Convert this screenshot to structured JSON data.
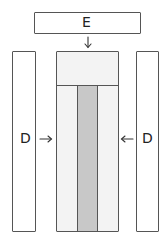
{
  "diagram": {
    "top_box": {
      "label": "E"
    },
    "left_box": {
      "label": "D"
    },
    "right_box": {
      "label": "D"
    },
    "center_block": {
      "top_section": "",
      "columns": [
        "",
        "",
        ""
      ]
    },
    "arrows": [
      {
        "from": "top_box",
        "to": "center_block",
        "direction": "down"
      },
      {
        "from": "left_box",
        "to": "center_block",
        "direction": "right"
      },
      {
        "from": "right_box",
        "to": "center_block",
        "direction": "left"
      }
    ],
    "colors": {
      "outline": "#555555",
      "light_fill": "#f3f3f3",
      "dark_fill": "#c8c8c8",
      "background": "#ffffff"
    }
  }
}
